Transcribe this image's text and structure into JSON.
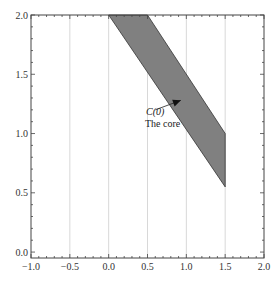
{
  "chart_data": {
    "type": "area",
    "title": "",
    "xlabel": "",
    "ylabel": "",
    "xlim": [
      -1.0,
      2.0
    ],
    "ylim": [
      -0.05,
      2.0
    ],
    "grid": {
      "vertical": true,
      "horizontal": false
    },
    "x_ticks": [
      -1.0,
      -0.5,
      0.0,
      0.5,
      1.0,
      1.5,
      2.0
    ],
    "x_tick_labels": [
      "−1.0",
      "−0.5",
      "0.0",
      "0.5",
      "1.0",
      "1.5",
      "2.0"
    ],
    "y_ticks": [
      0.0,
      0.5,
      1.0,
      1.5,
      2.0
    ],
    "y_tick_labels": [
      "0.0",
      "0.5",
      "1.0",
      "1.5",
      "2.0"
    ],
    "series": [
      {
        "name": "C(0) The core",
        "kind": "filled-polygon",
        "fill": "#808080",
        "stroke": "#333333",
        "points": [
          [
            0.0,
            2.0
          ],
          [
            0.5,
            2.0
          ],
          [
            1.5,
            1.0
          ],
          [
            1.5,
            0.55
          ]
        ]
      }
    ],
    "annotations": [
      {
        "label_line1": "C(0)",
        "label_line2": "The core",
        "text_x": 0.55,
        "text_y": 1.05,
        "arrow_from": [
          0.6,
          1.2
        ],
        "arrow_to": [
          0.93,
          1.28
        ]
      }
    ]
  },
  "colors": {
    "background": "#ffffff",
    "frame": "#444444",
    "grid": "#d8d8d8",
    "polygon_fill": "#808080",
    "polygon_stroke": "#333333",
    "text": "#333333"
  }
}
